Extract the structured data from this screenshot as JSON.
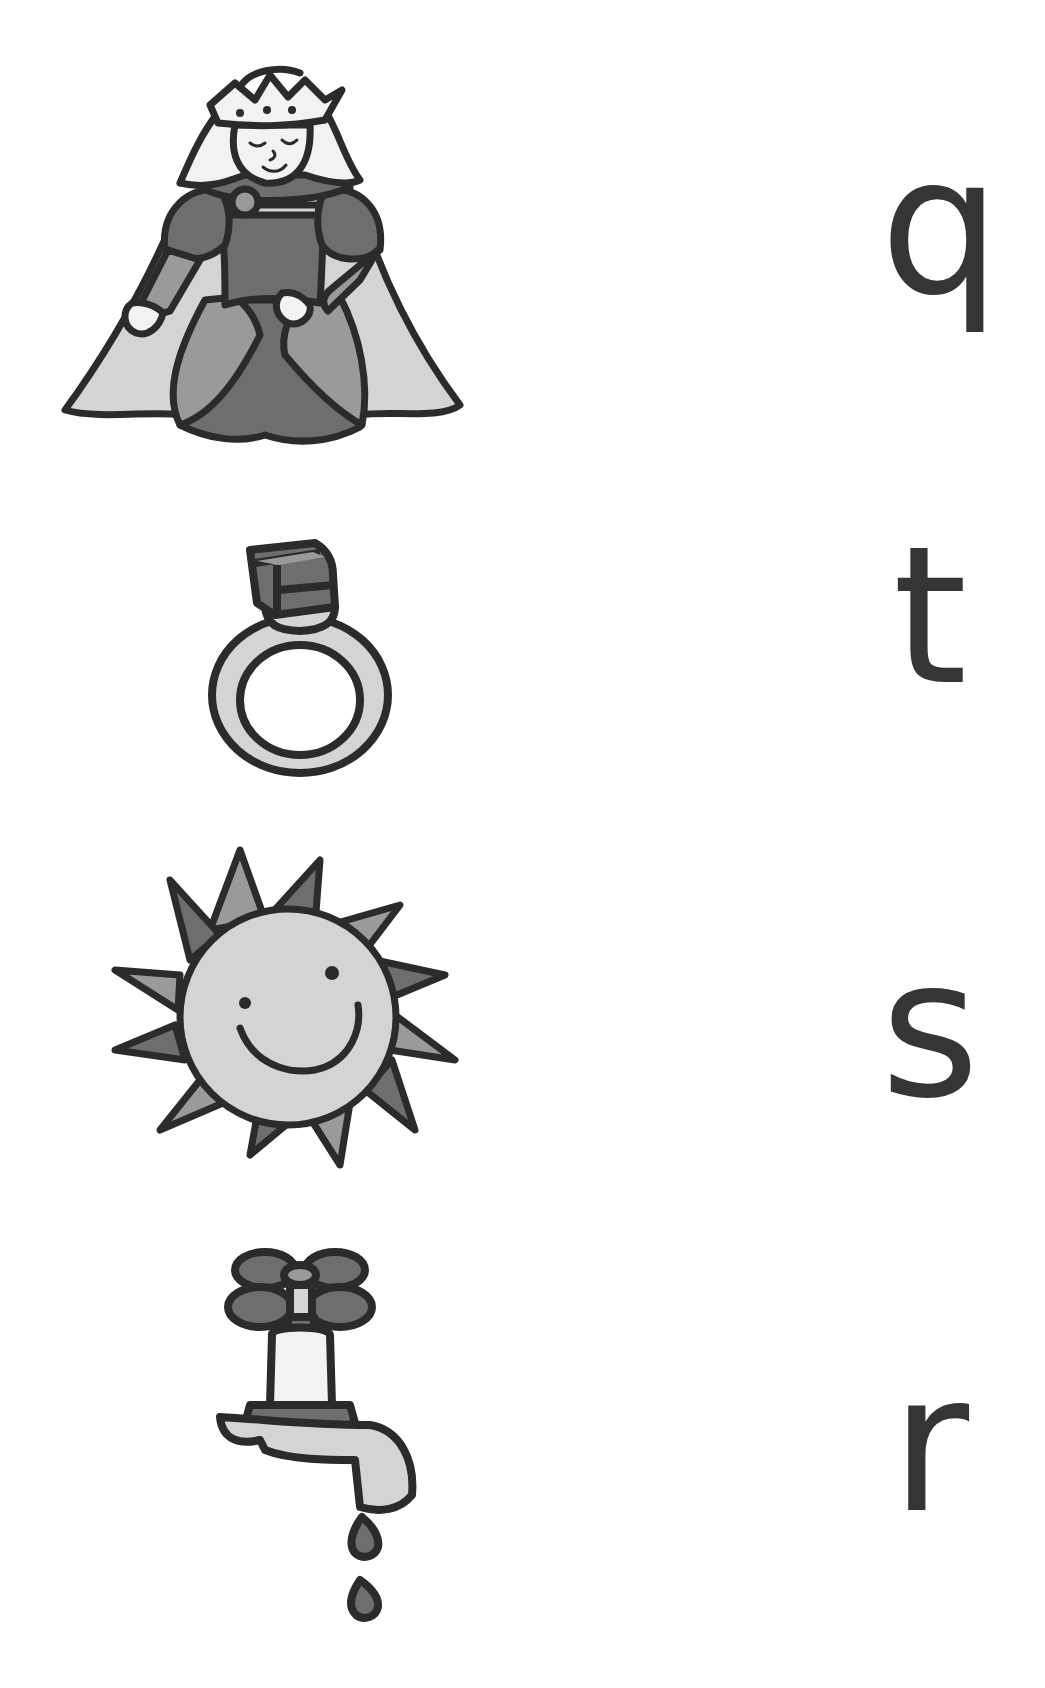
{
  "worksheet": {
    "activity": "match-picture-to-initial-letter",
    "pictures": [
      {
        "id": "queen",
        "label": "queen",
        "icon": "queen-icon"
      },
      {
        "id": "ring",
        "label": "ring",
        "icon": "ring-icon"
      },
      {
        "id": "sun",
        "label": "sun",
        "icon": "sun-icon"
      },
      {
        "id": "tap",
        "label": "tap",
        "icon": "tap-icon"
      }
    ],
    "letters": [
      "q",
      "t",
      "s",
      "r"
    ]
  },
  "colors": {
    "outline": "#2b2b2b",
    "dark_fill": "#6e6e6e",
    "mid_fill": "#9a9a9a",
    "light_fill": "#d4d4d4",
    "letter": "#353535",
    "background": "#ffffff"
  }
}
